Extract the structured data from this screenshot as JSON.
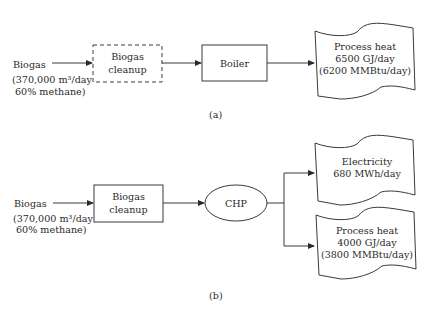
{
  "diagram_a": {
    "input": {
      "line1": "Biogas",
      "line2": "(370,000 m³/day",
      "line3": "60% methane)"
    },
    "cleanup": {
      "line1": "Biogas",
      "line2": "cleanup",
      "style": "dashed"
    },
    "boiler": {
      "label": "Boiler"
    },
    "output": {
      "line1": "Process heat",
      "line2": "6500 GJ/day",
      "line3": "(6200 MMBtu/day)"
    },
    "caption": "(a)"
  },
  "diagram_b": {
    "input": {
      "line1": "Biogas",
      "line2": "(370,000 m³/day",
      "line3": "60% methane)"
    },
    "cleanup": {
      "line1": "Biogas",
      "line2": "cleanup",
      "style": "solid"
    },
    "chp": {
      "label": "CHP"
    },
    "output_electricity": {
      "line1": "Electricity",
      "line2": "680 MWh/day"
    },
    "output_heat": {
      "line1": "Process heat",
      "line2": "4000 GJ/day",
      "line3": "(3800 MMBtu/day)"
    },
    "caption": "(b)"
  },
  "colors": {
    "line": "#3a3a3a",
    "text": "#2a2a2a",
    "background": "#ffffff"
  }
}
